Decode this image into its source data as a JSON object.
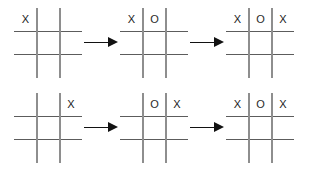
{
  "diagram": {
    "background_color": "#ffffff",
    "grid_line_color_horizontal": "#5c5c5c",
    "grid_line_color_vertical": "#8e8e8e",
    "mark_color": "#1a1a1a",
    "arrow_color": "#121212",
    "empty_cell": "",
    "arrow_icon_name": "arrow-right-icon",
    "sequences": [
      {
        "name": "top-sequence",
        "steps": [
          {
            "step_label": "1",
            "cells": [
              [
                "X",
                "",
                ""
              ],
              [
                "",
                "",
                ""
              ],
              [
                "",
                "",
                ""
              ]
            ]
          },
          {
            "step_label": "2",
            "cells": [
              [
                "X",
                "O",
                ""
              ],
              [
                "",
                "",
                ""
              ],
              [
                "",
                "",
                ""
              ]
            ]
          },
          {
            "step_label": "3",
            "cells": [
              [
                "X",
                "O",
                "X"
              ],
              [
                "",
                "",
                ""
              ],
              [
                "",
                "",
                ""
              ]
            ]
          }
        ]
      },
      {
        "name": "bottom-sequence",
        "steps": [
          {
            "step_label": "1",
            "cells": [
              [
                "",
                "",
                "X"
              ],
              [
                "",
                "",
                ""
              ],
              [
                "",
                "",
                ""
              ]
            ]
          },
          {
            "step_label": "2",
            "cells": [
              [
                "",
                "O",
                "X"
              ],
              [
                "",
                "",
                ""
              ],
              [
                "",
                "",
                ""
              ]
            ]
          },
          {
            "step_label": "3",
            "cells": [
              [
                "X",
                "O",
                "X"
              ],
              [
                "",
                "",
                ""
              ],
              [
                "",
                "",
                ""
              ]
            ]
          }
        ]
      }
    ]
  }
}
